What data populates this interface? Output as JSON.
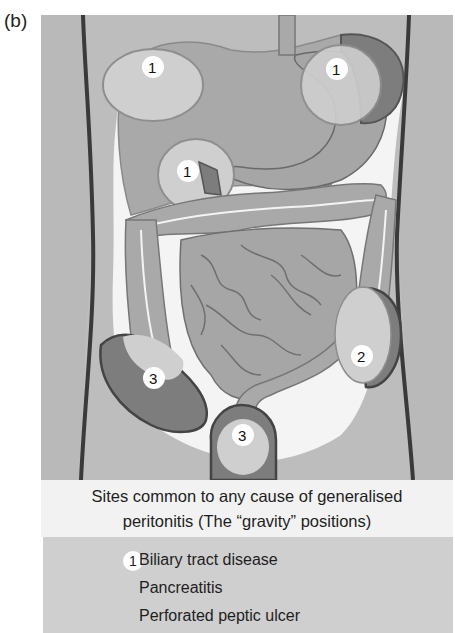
{
  "panel_label": "(b)",
  "figure": {
    "markers": [
      {
        "id": "m1a",
        "label": "1",
        "site": "right-upper-quadrant"
      },
      {
        "id": "m1b",
        "label": "1",
        "site": "left-upper-quadrant"
      },
      {
        "id": "m1c",
        "label": "1",
        "site": "epigastric-duodenum"
      },
      {
        "id": "m2",
        "label": "2",
        "site": "left-iliac-fossa"
      },
      {
        "id": "m3a",
        "label": "3",
        "site": "right-iliac-fossa"
      },
      {
        "id": "m3b",
        "label": "3",
        "site": "pelvis"
      }
    ]
  },
  "caption": {
    "line1": "Sites common to any cause of generalised",
    "line2": "peritonitis (The “gravity” positions)"
  },
  "legend": {
    "badge": "1",
    "items": [
      "Biliary tract disease",
      "Pancreatitis",
      "Perforated peptic ulcer"
    ]
  },
  "colors": {
    "background": "#b9b9b9",
    "organ": "#a3a3a3",
    "organ_light": "#cfcfcf",
    "dark_region": "#7d7d7d",
    "outline": "#4a4a4a",
    "caption_bg": "#f2f2f2",
    "legend_bg": "#cfcfcf"
  }
}
